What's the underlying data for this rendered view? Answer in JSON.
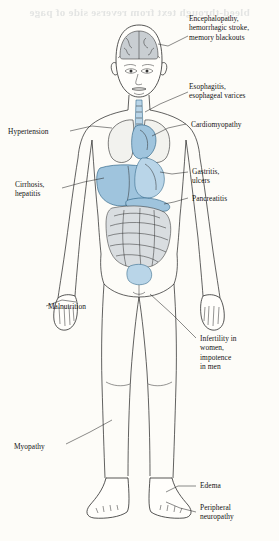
{
  "figure": {
    "bleed_text": "bleed-through text from reverse side of page",
    "paper_color": "#fdfcf8",
    "organ_accent_color": "#9fc4dd",
    "line_color": "#1e1e1e"
  },
  "labels": [
    {
      "id": "encephalopathy",
      "side": "right",
      "lines": [
        "Encephalopathy,",
        "hemorrhagic stroke,",
        "memory blackouts"
      ]
    },
    {
      "id": "esophagitis",
      "side": "right",
      "lines": [
        "Esophagitis,",
        "esophageal varices"
      ]
    },
    {
      "id": "cardiomyopathy",
      "side": "right",
      "lines": [
        "Cardiomyopathy"
      ]
    },
    {
      "id": "hypertension",
      "side": "left",
      "lines": [
        "Hypertension"
      ]
    },
    {
      "id": "cirrhosis",
      "side": "left",
      "lines": [
        "Cirrhosis,",
        "hepatitis"
      ]
    },
    {
      "id": "gastritis",
      "side": "right",
      "lines": [
        "Gastritis,",
        "ulcers"
      ]
    },
    {
      "id": "pancreatitis",
      "side": "right",
      "lines": [
        "Pancreatitis"
      ]
    },
    {
      "id": "malnutrition",
      "side": "left",
      "lines": [
        "Malnutrition"
      ]
    },
    {
      "id": "infertility",
      "side": "right",
      "lines": [
        "Infertility in",
        "women,",
        "impotence",
        "in men"
      ]
    },
    {
      "id": "myopathy",
      "side": "left",
      "lines": [
        "Myopathy"
      ]
    },
    {
      "id": "edema",
      "side": "right",
      "lines": [
        "Edema"
      ]
    },
    {
      "id": "peripheral-neuropathy",
      "side": "right",
      "lines": [
        "Peripheral",
        "neuropathy"
      ]
    }
  ],
  "organs": [
    {
      "id": "brain",
      "name": "brain"
    },
    {
      "id": "esophagus",
      "name": "esophagus"
    },
    {
      "id": "lungs",
      "name": "lungs"
    },
    {
      "id": "heart",
      "name": "heart"
    },
    {
      "id": "liver",
      "name": "liver"
    },
    {
      "id": "stomach",
      "name": "stomach"
    },
    {
      "id": "pancreas",
      "name": "pancreas"
    },
    {
      "id": "intestines",
      "name": "intestines"
    },
    {
      "id": "bladder",
      "name": "bladder"
    }
  ]
}
